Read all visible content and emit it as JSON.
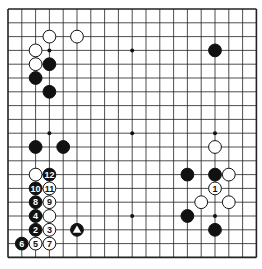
{
  "board": {
    "size": 19,
    "origin_x": 8,
    "origin_y": 9,
    "spacing": 13.8,
    "line_color": "#222222",
    "background": "#ffffff",
    "hoshi": [
      [
        3,
        3
      ],
      [
        9,
        3
      ],
      [
        15,
        3
      ],
      [
        3,
        9
      ],
      [
        9,
        9
      ],
      [
        15,
        9
      ],
      [
        3,
        15
      ],
      [
        9,
        15
      ],
      [
        15,
        15
      ]
    ]
  },
  "stones": [
    {
      "col": 3,
      "row": 2,
      "color": "white"
    },
    {
      "col": 5,
      "row": 2,
      "color": "white"
    },
    {
      "col": 2,
      "row": 3,
      "color": "white"
    },
    {
      "col": 2,
      "row": 4,
      "color": "white"
    },
    {
      "col": 3,
      "row": 4,
      "color": "black"
    },
    {
      "col": 2,
      "row": 5,
      "color": "black"
    },
    {
      "col": 3,
      "row": 6,
      "color": "black"
    },
    {
      "col": 15,
      "row": 3,
      "color": "black"
    },
    {
      "col": 2,
      "row": 10,
      "color": "black"
    },
    {
      "col": 4,
      "row": 10,
      "color": "black"
    },
    {
      "col": 2,
      "row": 12,
      "color": "white"
    },
    {
      "col": 3,
      "row": 12,
      "color": "black",
      "label": "12"
    },
    {
      "col": 2,
      "row": 13,
      "color": "black",
      "label": "10"
    },
    {
      "col": 3,
      "row": 13,
      "color": "white",
      "label": "11"
    },
    {
      "col": 2,
      "row": 14,
      "color": "black",
      "label": "8"
    },
    {
      "col": 3,
      "row": 14,
      "color": "white",
      "label": "9"
    },
    {
      "col": 2,
      "row": 15,
      "color": "black",
      "label": "4"
    },
    {
      "col": 3,
      "row": 15,
      "color": "white"
    },
    {
      "col": 2,
      "row": 16,
      "color": "black",
      "label": "2"
    },
    {
      "col": 3,
      "row": 16,
      "color": "white",
      "label": "3"
    },
    {
      "col": 5,
      "row": 16,
      "color": "black",
      "mark": "triangle"
    },
    {
      "col": 1,
      "row": 17,
      "color": "black",
      "label": "6"
    },
    {
      "col": 2,
      "row": 17,
      "color": "white",
      "label": "5"
    },
    {
      "col": 3,
      "row": 17,
      "color": "white",
      "label": "7"
    },
    {
      "col": 15,
      "row": 10,
      "color": "white"
    },
    {
      "col": 13,
      "row": 12,
      "color": "black"
    },
    {
      "col": 15,
      "row": 12,
      "color": "black"
    },
    {
      "col": 16,
      "row": 12,
      "color": "white"
    },
    {
      "col": 15,
      "row": 13,
      "color": "white",
      "label": "1"
    },
    {
      "col": 14,
      "row": 14,
      "color": "white"
    },
    {
      "col": 16,
      "row": 14,
      "color": "white"
    },
    {
      "col": 13,
      "row": 15,
      "color": "black"
    },
    {
      "col": 15,
      "row": 16,
      "color": "black"
    }
  ]
}
